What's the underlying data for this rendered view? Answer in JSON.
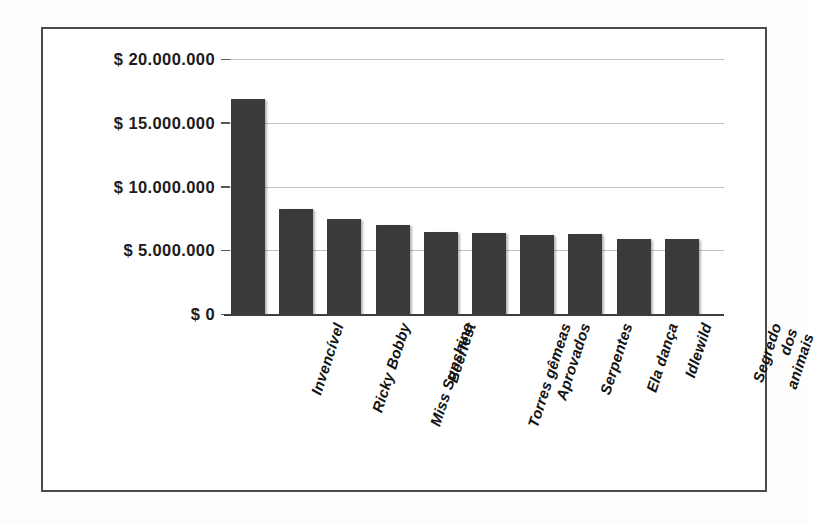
{
  "chart_data": {
    "type": "bar",
    "title": "",
    "subtitle": "",
    "xlabel": "",
    "ylabel": "",
    "ylim": [
      0,
      20000000
    ],
    "grid": true,
    "legend": false,
    "currency_symbol": "$",
    "categories": [
      "Invencível",
      "Ricky Bobby",
      "Miss Sunshine",
      "Beerfest",
      "Torres gêmeas",
      "Aprovados",
      "Serpentes",
      "Ela dança",
      "Idlewild",
      "Segredo dos animais"
    ],
    "values": [
      16900000,
      8200000,
      7450000,
      6950000,
      6400000,
      6350000,
      6200000,
      6250000,
      5900000,
      5850000
    ],
    "ytick_labels": [
      "$ 20.000.000",
      "$ 15.000.000",
      "$ 10.000.000",
      "$ 5.000.000",
      "$ 0"
    ],
    "ytick_values": [
      20000000,
      15000000,
      10000000,
      5000000,
      0
    ],
    "colors": {
      "bar": "#3a3a3a",
      "gridline": "#c2c2c2",
      "axis": "#3f3f3f",
      "text": "#131313",
      "frame": "#4a4a4a",
      "background": "#ffffff"
    }
  }
}
